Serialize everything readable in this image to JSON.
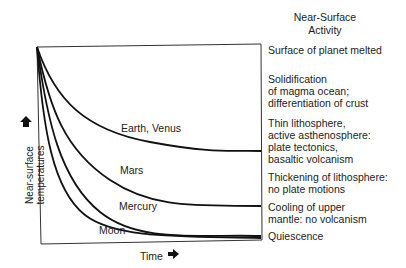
{
  "header": {
    "line1": "Near-Surface",
    "line2": "Activity"
  },
  "axes": {
    "y_label_line1": "Near-surface",
    "y_label_line2": "temperatures",
    "x_label": "Time",
    "y_arrow_icon": "arrow-up-icon",
    "x_arrow_icon": "arrow-right-icon"
  },
  "curves": [
    {
      "name": "Earth, Venus",
      "end_stage": "Thin lithosphere, active asthenosphere"
    },
    {
      "name": "Mars",
      "end_stage": "Thickening of lithosphere"
    },
    {
      "name": "Mercury",
      "end_stage": "Quiescence"
    },
    {
      "name": "Moon",
      "end_stage": "Quiescence"
    }
  ],
  "stages": [
    {
      "lines": [
        "Surface of planet melted"
      ]
    },
    {
      "lines": [
        "Solidification",
        "of magma ocean;",
        "differentiation of crust"
      ]
    },
    {
      "lines": [
        "Thin lithosphere,",
        "active asthenosphere:",
        "plate tectonics,",
        "basaltic volcanism"
      ]
    },
    {
      "lines": [
        "Thickening of lithosphere:",
        "no plate motions"
      ]
    },
    {
      "lines": [
        "Cooling of upper",
        "mantle: no volcanism"
      ]
    },
    {
      "lines": [
        "Quiescence"
      ]
    }
  ]
}
